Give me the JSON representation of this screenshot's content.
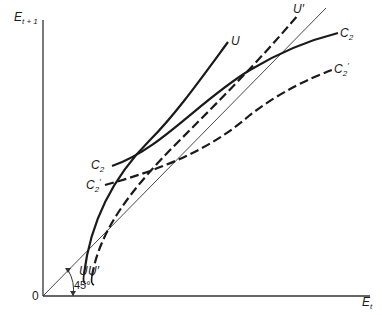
{
  "figure": {
    "y_axis_label": {
      "main": "E",
      "sub": "t + 1"
    },
    "x_axis_label": {
      "main": "E",
      "sub": "t"
    },
    "origin_label": "0",
    "angle_label": "45°",
    "curves": {
      "U": {
        "label": "U",
        "style": "solid"
      },
      "U_prime": {
        "label": "U′",
        "style": "dashed"
      },
      "C2": {
        "label": "C",
        "sub": "2",
        "style": "solid"
      },
      "C2_prime": {
        "label": "C",
        "sub": "2",
        "sup": "′",
        "style": "dashed"
      },
      "diagonal": {
        "label": "45° line",
        "style": "thin"
      }
    },
    "bottom_labels": {
      "U": "U",
      "U_prime": "U′"
    },
    "left_labels": {
      "C2": "C",
      "C2_sub": "2",
      "C2_prime": "C",
      "C2_prime_sub": "2",
      "C2_prime_sup": "′"
    }
  }
}
